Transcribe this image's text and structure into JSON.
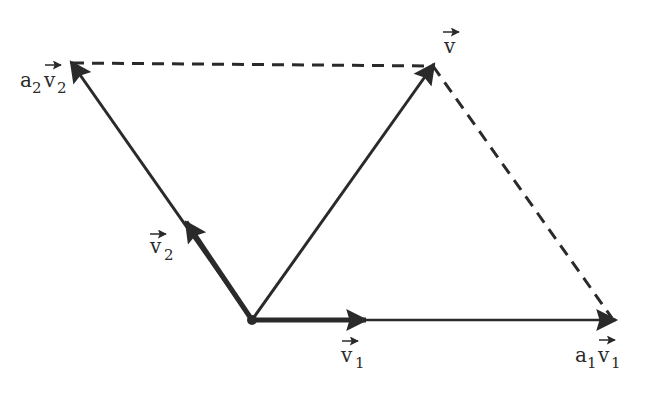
{
  "diagram": {
    "type": "vector-parallelogram",
    "colors": {
      "line": "#2a2a2a",
      "background": "#ffffff"
    },
    "origin": {
      "x": 252,
      "y": 320
    },
    "vectors": [
      {
        "id": "v1",
        "label_base": "v",
        "label_sub": "1",
        "from": [
          252,
          320
        ],
        "to": [
          365,
          320
        ],
        "style": "bold"
      },
      {
        "id": "a1v1",
        "label_coef": "a",
        "label_coef_sub": "1",
        "label_base": "v",
        "label_sub": "1",
        "from": [
          252,
          320
        ],
        "to": [
          615,
          320
        ],
        "style": "solid"
      },
      {
        "id": "v2",
        "label_base": "v",
        "label_sub": "2",
        "from": [
          252,
          320
        ],
        "to": [
          190,
          224
        ],
        "style": "bold"
      },
      {
        "id": "a2v2",
        "label_coef": "a",
        "label_coef_sub": "2",
        "label_base": "v",
        "label_sub": "2",
        "from": [
          252,
          320
        ],
        "to": [
          72,
          63
        ],
        "style": "solid"
      },
      {
        "id": "v",
        "label_base": "v",
        "from": [
          252,
          320
        ],
        "to": [
          433,
          66
        ],
        "style": "solid"
      }
    ],
    "dashed_lines": [
      {
        "from": [
          72,
          63
        ],
        "to": [
          433,
          66
        ]
      },
      {
        "from": [
          433,
          66
        ],
        "to": [
          612,
          318
        ]
      }
    ],
    "labels": {
      "v": {
        "text": "v",
        "x": 444,
        "y": 52
      },
      "v1": {
        "text": "v",
        "sub": "1",
        "x": 343,
        "y": 362
      },
      "v2": {
        "text": "v",
        "sub": "2",
        "x": 150,
        "y": 252
      },
      "a1v1": {
        "coef": "a",
        "coef_sub": "1",
        "text": "v",
        "sub": "1",
        "x": 575,
        "y": 362
      },
      "a2v2": {
        "coef": "a",
        "coef_sub": "2",
        "text": "v",
        "sub": "2",
        "x": 20,
        "y": 86
      }
    }
  }
}
